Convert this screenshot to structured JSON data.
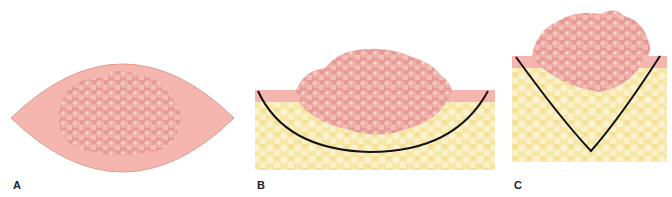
{
  "figure": {
    "panels": [
      {
        "id": "A",
        "label": "A",
        "description": "Top view: elliptical (lens-shaped) excision outline around a lobulated pink lesion"
      },
      {
        "id": "B",
        "label": "B",
        "description": "Cross-section: lesion over fatty tissue with shallow rounded (U-shaped) excision line"
      },
      {
        "id": "C",
        "label": "C",
        "description": "Cross-section: lesion over fatty tissue with deep V-shaped (wedge) excision line"
      }
    ],
    "colors": {
      "skin_pink": "#f4b6ae",
      "skin_edge": "#e49a90",
      "lesion": "#e59a95",
      "lesion_highlight": "#f8d0c8",
      "fat_yellow": "#f6e7a6",
      "fat_light": "#fbf2cf",
      "incision_line": "#111111"
    }
  }
}
